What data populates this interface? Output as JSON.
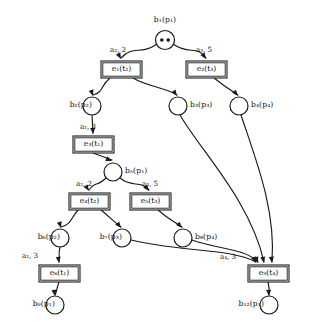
{
  "diagram": {
    "kind": "petri-net-unfolding",
    "width": 309,
    "height": 334,
    "stroke_color": "#1a1a1a",
    "background_color": "#ffffff"
  },
  "places": [
    {
      "id": "b1",
      "label_name": "b",
      "label_sub": "1",
      "label_of": "(p",
      "label_of_sub": "1",
      "label_of_close": ")",
      "text": "b₁(p₁)",
      "cx": 165,
      "cy": 40,
      "r": 9.5,
      "tokens": 2,
      "label_x": 150,
      "label_y": 16,
      "label_align": "center"
    },
    {
      "id": "b2",
      "text": "b₂(p₂)",
      "cx": 92,
      "cy": 106,
      "r": 9,
      "tokens": 0,
      "label_x": 56,
      "label_y": 101,
      "label_align": "right"
    },
    {
      "id": "b3",
      "text": "b₃(p₃)",
      "cx": 178,
      "cy": 106,
      "r": 9,
      "tokens": 0,
      "label_x": 190,
      "label_y": 101,
      "label_align": "left"
    },
    {
      "id": "b4",
      "text": "b₄(p₄)",
      "cx": 239,
      "cy": 106,
      "r": 9,
      "tokens": 0,
      "label_x": 251,
      "label_y": 101,
      "label_align": "left"
    },
    {
      "id": "b5",
      "text": "b₅(p₁)",
      "cx": 113,
      "cy": 172,
      "r": 9,
      "tokens": 0,
      "label_x": 125,
      "label_y": 167,
      "label_align": "left"
    },
    {
      "id": "b6",
      "text": "b₆(p₂)",
      "cx": 60,
      "cy": 238,
      "r": 9,
      "tokens": 0,
      "label_x": 24,
      "label_y": 233,
      "label_align": "right"
    },
    {
      "id": "b7",
      "text": "b₇(p₃)",
      "cx": 122,
      "cy": 238,
      "r": 9,
      "tokens": 0,
      "label_x": 86,
      "label_y": 233,
      "label_align": "right"
    },
    {
      "id": "b8",
      "text": "b₈(p₄)",
      "cx": 183,
      "cy": 238,
      "r": 9,
      "tokens": 0,
      "label_x": 195,
      "label_y": 233,
      "label_align": "left"
    },
    {
      "id": "b9",
      "text": "b₉(p₁)",
      "cx": 55,
      "cy": 305,
      "r": 9,
      "tokens": 0,
      "label_x": 19,
      "label_y": 300,
      "label_align": "right"
    },
    {
      "id": "b12",
      "text": "b₁₂(p₁)",
      "cx": 269,
      "cy": 305,
      "r": 9,
      "tokens": 0,
      "label_x": 228,
      "label_y": 300,
      "label_align": "right"
    }
  ],
  "transitions": [
    {
      "id": "e1",
      "text": "e₁(t₂)",
      "x": 101,
      "y": 61,
      "w": 41,
      "h": 17,
      "label_x": 101,
      "label_y": 65
    },
    {
      "id": "e2",
      "text": "e₂(t₃)",
      "x": 186,
      "y": 61,
      "w": 41,
      "h": 17,
      "label_x": 186,
      "label_y": 65
    },
    {
      "id": "e3",
      "text": "e₃(t₁)",
      "x": 73,
      "y": 136,
      "w": 41,
      "h": 17,
      "label_x": 73,
      "label_y": 140
    },
    {
      "id": "e4",
      "text": "e₄(t₂)",
      "x": 69,
      "y": 193,
      "w": 41,
      "h": 17,
      "label_x": 69,
      "label_y": 197
    },
    {
      "id": "e5",
      "text": "e₅(t₃)",
      "x": 130,
      "y": 193,
      "w": 41,
      "h": 17,
      "label_x": 130,
      "label_y": 197
    },
    {
      "id": "e6",
      "text": "e₆(t₁)",
      "x": 39,
      "y": 265,
      "w": 41,
      "h": 17,
      "label_x": 39,
      "label_y": 269
    },
    {
      "id": "e9",
      "text": "e₉(t₄)",
      "x": 248,
      "y": 265,
      "w": 41,
      "h": 17,
      "label_x": 248,
      "label_y": 269
    }
  ],
  "arc_labels": [
    {
      "id": "lbl-e1",
      "text": "a₂, 2",
      "x": 110,
      "y": 46
    },
    {
      "id": "lbl-e2",
      "text": "a₃, 5",
      "x": 196,
      "y": 46
    },
    {
      "id": "lbl-e3",
      "text": "a₁, 3",
      "x": 80,
      "y": 123
    },
    {
      "id": "lbl-e4",
      "text": "a₂, 2",
      "x": 76,
      "y": 180
    },
    {
      "id": "lbl-e5",
      "text": "a₃, 5",
      "x": 142,
      "y": 180
    },
    {
      "id": "lbl-e6",
      "text": "a₁, 3",
      "x": 22,
      "y": 252
    },
    {
      "id": "lbl-e9",
      "text": "a₄, 3",
      "x": 220,
      "y": 253
    }
  ],
  "arcs": [
    {
      "id": "arc-b1-e1",
      "from": "b1",
      "to": "e1",
      "d": "M 157,44 C 140,56 134,44 121,58"
    },
    {
      "id": "arc-b1-e2",
      "from": "b1",
      "to": "e2",
      "d": "M 173,44 C 190,56 196,44 206,58"
    },
    {
      "id": "arc-e1-b2",
      "from": "e1",
      "to": "b2",
      "d": "M 110,78 C 100,86 104,92 93,95"
    },
    {
      "id": "arc-e1-b3",
      "from": "e1",
      "to": "b3",
      "d": "M 133,78 C 146,86 166,88 177,95"
    },
    {
      "id": "arc-e2-b4",
      "from": "e2",
      "to": "b4",
      "d": "M 214,78 C 224,86 230,90 238,95"
    },
    {
      "id": "arc-b2-e3",
      "from": "b2",
      "to": "e3",
      "d": "M 92,115 L 93,133"
    },
    {
      "id": "arc-e3-b5",
      "from": "e3",
      "to": "b5",
      "d": "M 93,153 L 112,160"
    },
    {
      "id": "arc-b5-e4",
      "from": "b5",
      "to": "e4",
      "d": "M 106,178 C 96,188 96,180 89,190"
    },
    {
      "id": "arc-b5-e5",
      "from": "b5",
      "to": "e5",
      "d": "M 120,178 C 132,188 140,180 149,190"
    },
    {
      "id": "arc-e4-b6",
      "from": "e4",
      "to": "b6",
      "d": "M 78,210 C 70,219 72,224 61,227"
    },
    {
      "id": "arc-e4-b7",
      "from": "e4",
      "to": "b7",
      "d": "M 101,210 C 112,219 114,222 121,227"
    },
    {
      "id": "arc-e5-b8",
      "from": "e5",
      "to": "b8",
      "d": "M 158,210 C 168,219 175,222 182,227"
    },
    {
      "id": "arc-b6-e6",
      "from": "b6",
      "to": "e6",
      "d": "M 60,247 C 58,255 60,256 59,262"
    },
    {
      "id": "arc-e6-b9",
      "from": "e6",
      "to": "b9",
      "d": "M 59,282 C 56,290 57,292 55,295"
    },
    {
      "id": "arc-b3-e9",
      "from": "b3",
      "to": "e9",
      "d": "M 180,115 C 200,150 250,200 264,262"
    },
    {
      "id": "arc-b4-e9",
      "from": "b4",
      "to": "e9",
      "d": "M 241,115 C 256,160 276,210 272,262"
    },
    {
      "id": "arc-b7-e9",
      "from": "b7",
      "to": "e9",
      "d": "M 131,240 C 180,252 230,248 256,262"
    },
    {
      "id": "arc-b8-e9",
      "from": "b8",
      "to": "e9",
      "d": "M 192,240 C 220,250 244,248 258,262"
    },
    {
      "id": "arc-e9-b12",
      "from": "e9",
      "to": "b12",
      "d": "M 268,282 C 270,290 269,292 269,295"
    }
  ],
  "arrow_heads": [
    {
      "id": "head-e1",
      "x": 121,
      "y": 59,
      "angle": 62
    },
    {
      "id": "head-e2",
      "x": 206,
      "y": 59,
      "angle": 56
    },
    {
      "id": "head-b2",
      "x": 93,
      "y": 96,
      "angle": 72
    },
    {
      "id": "head-b3",
      "x": 177,
      "y": 96,
      "angle": 55
    },
    {
      "id": "head-b4",
      "x": 238,
      "y": 96,
      "angle": 50
    },
    {
      "id": "head-e3",
      "x": 93,
      "y": 134,
      "angle": 87
    },
    {
      "id": "head-b5",
      "x": 112,
      "y": 161,
      "angle": 22
    },
    {
      "id": "head-e4",
      "x": 89,
      "y": 191,
      "angle": 58
    },
    {
      "id": "head-e5",
      "x": 149,
      "y": 191,
      "angle": 52
    },
    {
      "id": "head-b6",
      "x": 61,
      "y": 228,
      "angle": 74
    },
    {
      "id": "head-b7",
      "x": 121,
      "y": 228,
      "angle": 52
    },
    {
      "id": "head-b8",
      "x": 182,
      "y": 228,
      "angle": 48
    },
    {
      "id": "head-e6",
      "x": 59,
      "y": 263,
      "angle": 83
    },
    {
      "id": "head-b9",
      "x": 55,
      "y": 296,
      "angle": 80
    },
    {
      "id": "head-e9a",
      "x": 256,
      "y": 263,
      "angle": 66
    },
    {
      "id": "head-e9b",
      "x": 258,
      "y": 263,
      "angle": 70
    },
    {
      "id": "head-e9c",
      "x": 264,
      "y": 263,
      "angle": 78
    },
    {
      "id": "head-e9d",
      "x": 272,
      "y": 263,
      "angle": 84
    },
    {
      "id": "head-b12",
      "x": 269,
      "y": 296,
      "angle": 86
    }
  ]
}
